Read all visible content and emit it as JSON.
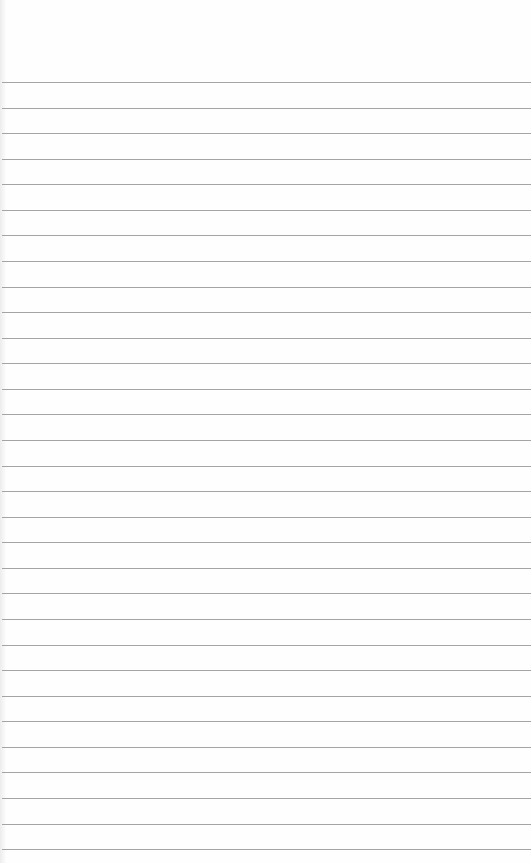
{
  "paper": {
    "type": "lined notepad page",
    "background": "#fefefe",
    "rule_color": "#a4a4a4",
    "first_rule_y": 82,
    "rule_spacing": 25.57,
    "rule_count": 31
  }
}
